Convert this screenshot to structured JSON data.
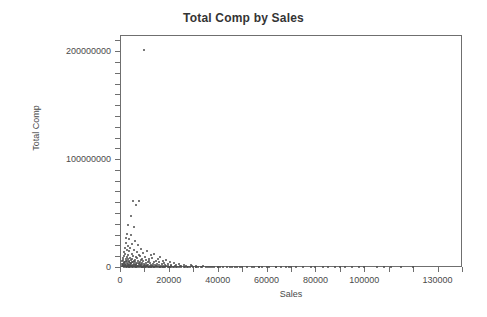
{
  "chart_data": {
    "type": "scatter",
    "title": "Total Comp by Sales",
    "xlabel": "Sales",
    "ylabel": "Total Comp",
    "xlim": [
      0,
      140000
    ],
    "ylim": [
      0,
      215000000
    ],
    "grid": false,
    "legend": null,
    "x_tick_values": [
      0,
      10000,
      20000,
      30000,
      40000,
      50000,
      60000,
      70000,
      80000,
      90000,
      100000,
      110000,
      120000,
      130000,
      140000
    ],
    "x_tick_labels": [
      "0",
      "",
      "20000",
      "",
      "40000",
      "",
      "60000",
      "",
      "80000",
      "",
      "100000",
      "",
      "",
      "130000",
      ""
    ],
    "y_tick_values": [
      0,
      10000000,
      20000000,
      30000000,
      40000000,
      50000000,
      60000000,
      70000000,
      80000000,
      90000000,
      100000000,
      110000000,
      120000000,
      130000000,
      140000000,
      150000000,
      160000000,
      170000000,
      180000000,
      190000000,
      200000000,
      210000000
    ],
    "y_tick_labels": [
      "0",
      "",
      "",
      "",
      "",
      "",
      "",
      "",
      "",
      "",
      "100000000",
      "",
      "",
      "",
      "",
      "",
      "",
      "",
      "",
      "",
      "200000000",
      ""
    ],
    "marker_color": "#4d4d4d",
    "marker_size": 2,
    "points": [
      [
        9800,
        201000000
      ],
      [
        5200,
        61000000
      ],
      [
        7600,
        61500000
      ],
      [
        6400,
        57000000
      ],
      [
        4300,
        47000000
      ],
      [
        3200,
        39000000
      ],
      [
        5600,
        37000000
      ],
      [
        3000,
        31000000
      ],
      [
        4600,
        30000000
      ],
      [
        2600,
        27000000
      ],
      [
        3800,
        25500000
      ],
      [
        6200,
        24000000
      ],
      [
        2400,
        22000000
      ],
      [
        5000,
        21000000
      ],
      [
        7200,
        20000000
      ],
      [
        3400,
        19000000
      ],
      [
        2000,
        18000000
      ],
      [
        4200,
        17500000
      ],
      [
        8600,
        17000000
      ],
      [
        2800,
        16000000
      ],
      [
        5800,
        15500000
      ],
      [
        11000,
        15000000
      ],
      [
        3600,
        14500000
      ],
      [
        1800,
        14000000
      ],
      [
        6800,
        13500000
      ],
      [
        9400,
        13000000
      ],
      [
        2200,
        12500000
      ],
      [
        4800,
        12000000
      ],
      [
        14000,
        12500000
      ],
      [
        7800,
        11500000
      ],
      [
        3100,
        11000000
      ],
      [
        12600,
        11000000
      ],
      [
        5400,
        10500000
      ],
      [
        1600,
        10000000
      ],
      [
        8200,
        10000000
      ],
      [
        10200,
        9500000
      ],
      [
        2900,
        9200000
      ],
      [
        6600,
        9000000
      ],
      [
        16500,
        9500000
      ],
      [
        4000,
        8600000
      ],
      [
        13200,
        8500000
      ],
      [
        1400,
        8200000
      ],
      [
        7000,
        8000000
      ],
      [
        9000,
        7800000
      ],
      [
        2500,
        7600000
      ],
      [
        5100,
        7400000
      ],
      [
        11800,
        7200000
      ],
      [
        3300,
        7000000
      ],
      [
        15400,
        7000000
      ],
      [
        6000,
        6800000
      ],
      [
        1200,
        6600000
      ],
      [
        8400,
        6500000
      ],
      [
        19000,
        6800000
      ],
      [
        4400,
        6300000
      ],
      [
        10600,
        6200000
      ],
      [
        2700,
        6000000
      ],
      [
        12000,
        5900000
      ],
      [
        5900,
        5800000
      ],
      [
        17500,
        5800000
      ],
      [
        3500,
        5600000
      ],
      [
        7400,
        5500000
      ],
      [
        1000,
        5400000
      ],
      [
        9600,
        5300000
      ],
      [
        14600,
        5200000
      ],
      [
        2300,
        5100000
      ],
      [
        4900,
        5000000
      ],
      [
        6300,
        4900000
      ],
      [
        20500,
        5000000
      ],
      [
        11400,
        4800000
      ],
      [
        3700,
        4700000
      ],
      [
        8000,
        4600000
      ],
      [
        1700,
        4500000
      ],
      [
        13800,
        4400000
      ],
      [
        5300,
        4300000
      ],
      [
        16000,
        4300000
      ],
      [
        2100,
        4200000
      ],
      [
        9200,
        4100000
      ],
      [
        6900,
        4000000
      ],
      [
        18200,
        4000000
      ],
      [
        3900,
        3900000
      ],
      [
        10800,
        3800000
      ],
      [
        1500,
        3700000
      ],
      [
        7700,
        3600000
      ],
      [
        4500,
        3500000
      ],
      [
        22000,
        3600000
      ],
      [
        12400,
        3400000
      ],
      [
        2900,
        3300000
      ],
      [
        15000,
        3200000
      ],
      [
        5700,
        3200000
      ],
      [
        8800,
        3100000
      ],
      [
        1100,
        3000000
      ],
      [
        19800,
        3100000
      ],
      [
        3400,
        2900000
      ],
      [
        10000,
        2800000
      ],
      [
        6500,
        2800000
      ],
      [
        24000,
        2900000
      ],
      [
        13500,
        2700000
      ],
      [
        2200,
        2600000
      ],
      [
        17000,
        2600000
      ],
      [
        4700,
        2500000
      ],
      [
        7900,
        2400000
      ],
      [
        900,
        2400000
      ],
      [
        11200,
        2300000
      ],
      [
        21000,
        2300000
      ],
      [
        3100,
        2200000
      ],
      [
        14200,
        2100000
      ],
      [
        5500,
        2100000
      ],
      [
        9100,
        2000000
      ],
      [
        1900,
        2000000
      ],
      [
        26000,
        2100000
      ],
      [
        12800,
        1900000
      ],
      [
        6100,
        1800000
      ],
      [
        18500,
        1900000
      ],
      [
        3600,
        1800000
      ],
      [
        8300,
        1700000
      ],
      [
        1300,
        1700000
      ],
      [
        10400,
        1600000
      ],
      [
        23000,
        1700000
      ],
      [
        4100,
        1600000
      ],
      [
        15800,
        1500000
      ],
      [
        6700,
        1500000
      ],
      [
        29000,
        1600000
      ],
      [
        2400,
        1400000
      ],
      [
        11600,
        1400000
      ],
      [
        7300,
        1300000
      ],
      [
        19500,
        1300000
      ],
      [
        3800,
        1300000
      ],
      [
        9700,
        1200000
      ],
      [
        800,
        1200000
      ],
      [
        13000,
        1200000
      ],
      [
        25000,
        1200000
      ],
      [
        5000,
        1100000
      ],
      [
        16800,
        1100000
      ],
      [
        2700,
        1000000
      ],
      [
        8700,
        1000000
      ],
      [
        31000,
        1100000
      ],
      [
        11000,
        950000
      ],
      [
        4300,
        900000
      ],
      [
        20800,
        950000
      ],
      [
        6800,
        900000
      ],
      [
        14800,
        850000
      ],
      [
        1600,
        850000
      ],
      [
        9900,
        800000
      ],
      [
        27000,
        850000
      ],
      [
        3300,
        780000
      ],
      [
        12200,
        750000
      ],
      [
        7500,
        720000
      ],
      [
        17800,
        700000
      ],
      [
        5200,
        700000
      ],
      [
        34000,
        750000
      ],
      [
        10600,
        650000
      ],
      [
        2000,
        620000
      ],
      [
        22500,
        650000
      ],
      [
        8100,
        600000
      ],
      [
        15200,
        580000
      ],
      [
        4600,
        560000
      ],
      [
        13600,
        540000
      ],
      [
        29500,
        560000
      ],
      [
        6300,
        520000
      ],
      [
        19000,
        500000
      ],
      [
        1200,
        480000
      ],
      [
        10100,
        460000
      ],
      [
        24500,
        470000
      ],
      [
        3700,
        440000
      ],
      [
        16500,
        420000
      ],
      [
        7000,
        400000
      ],
      [
        37000,
        430000
      ],
      [
        12000,
        380000
      ],
      [
        2500,
        360000
      ],
      [
        21500,
        360000
      ],
      [
        9000,
        340000
      ],
      [
        14000,
        320000
      ],
      [
        5500,
        300000
      ],
      [
        32000,
        320000
      ],
      [
        18000,
        280000
      ],
      [
        11300,
        260000
      ],
      [
        4000,
        240000
      ],
      [
        26500,
        250000
      ],
      [
        8400,
        220000
      ],
      [
        15800,
        200000
      ],
      [
        1800,
        190000
      ],
      [
        41000,
        220000
      ],
      [
        23000,
        180000
      ],
      [
        6600,
        170000
      ],
      [
        12700,
        160000
      ],
      [
        35000,
        170000
      ],
      [
        19800,
        150000
      ],
      [
        3000,
        140000
      ],
      [
        9600,
        130000
      ],
      [
        28000,
        140000
      ],
      [
        16200,
        120000
      ],
      [
        47000,
        150000
      ],
      [
        5100,
        110000
      ],
      [
        13400,
        100000
      ],
      [
        22000,
        100000
      ],
      [
        38500,
        110000
      ],
      [
        7800,
        90000
      ],
      [
        31000,
        90000
      ],
      [
        17500,
        85000
      ],
      [
        10800,
        80000
      ],
      [
        55000,
        95000
      ],
      [
        25000,
        75000
      ],
      [
        3500,
        70000
      ],
      [
        44000,
        75000
      ],
      [
        14500,
        65000
      ],
      [
        20500,
        62000
      ],
      [
        60000,
        70000
      ],
      [
        8900,
        58000
      ],
      [
        33000,
        58000
      ],
      [
        11900,
        52000
      ],
      [
        49000,
        55000
      ],
      [
        27500,
        48000
      ],
      [
        18500,
        45000
      ],
      [
        6000,
        42000
      ],
      [
        69000,
        50000
      ],
      [
        23500,
        40000
      ],
      [
        40000,
        40000
      ],
      [
        15000,
        36000
      ],
      [
        57000,
        38000
      ],
      [
        30000,
        34000
      ],
      [
        9500,
        30000
      ],
      [
        52000,
        32000
      ],
      [
        21000,
        28000
      ],
      [
        64000,
        30000
      ],
      [
        36000,
        26000
      ],
      [
        12500,
        24000
      ],
      [
        80000,
        28000
      ],
      [
        26000,
        22000
      ],
      [
        45000,
        22000
      ],
      [
        17000,
        20000
      ],
      [
        72000,
        22000
      ],
      [
        95000,
        25000
      ],
      [
        33500,
        18000
      ],
      [
        58000,
        18000
      ],
      [
        20000,
        16000
      ],
      [
        88000,
        18000
      ],
      [
        42000,
        15000
      ],
      [
        105000,
        18000
      ],
      [
        28500,
        14000
      ],
      [
        66000,
        14000
      ],
      [
        24000,
        12000
      ],
      [
        50000,
        12000
      ],
      [
        115000,
        15000
      ],
      [
        78000,
        12000
      ],
      [
        37500,
        10000
      ],
      [
        98000,
        11000
      ],
      [
        31000,
        9000
      ],
      [
        61000,
        9000
      ],
      [
        85000,
        9000
      ],
      [
        46000,
        8000
      ],
      [
        108000,
        9000
      ],
      [
        70000,
        7000
      ],
      [
        54000,
        6500
      ],
      [
        40000,
        6000
      ],
      [
        92000,
        6500
      ],
      [
        120000,
        8000
      ],
      [
        64000,
        5000
      ],
      [
        48000,
        4500
      ],
      [
        100000,
        5000
      ],
      [
        75000,
        4000
      ],
      [
        57000,
        3500
      ],
      [
        83000,
        3000
      ],
      [
        111000,
        3500
      ],
      [
        68000,
        2500
      ],
      [
        90000,
        2000
      ]
    ]
  }
}
